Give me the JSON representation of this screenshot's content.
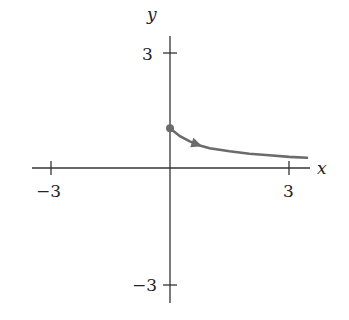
{
  "chart_data": {
    "type": "line",
    "title": "",
    "xlabel": "x",
    "ylabel": "y",
    "xlim": [
      -3.2,
      3.5
    ],
    "ylim": [
      -3.4,
      3.6
    ],
    "x_ticks": [
      "-3",
      "3"
    ],
    "y_ticks": [
      "3",
      "-3"
    ],
    "grid": false,
    "series": [
      {
        "name": "curve",
        "color": "#6b6b6b",
        "start_point": [
          0,
          1
        ],
        "direction_arrow": "increasing x",
        "x": [
          0,
          0.25,
          0.5,
          0.75,
          1.0,
          1.5,
          2.0,
          2.5,
          3.0,
          3.45
        ],
        "y": [
          1.0,
          0.8,
          0.67,
          0.57,
          0.5,
          0.42,
          0.36,
          0.32,
          0.28,
          0.26
        ]
      }
    ]
  },
  "labels": {
    "x_axis": "x",
    "y_axis": "y",
    "x_neg": "−3",
    "x_pos": "3",
    "y_pos": "3",
    "y_neg": "−3"
  }
}
